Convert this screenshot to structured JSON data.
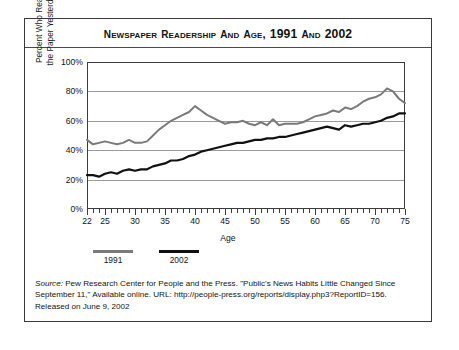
{
  "title": {
    "text": "NEWSPAPER READERSHIP AND AGE, 1991 AND 2002"
  },
  "axes": {
    "ylabel_line1": "Percent Who Read",
    "ylabel_line2": "the Paper Yesterday",
    "xlabel": "Age",
    "ytick_labels": [
      "100%",
      "80%",
      "60%",
      "40%",
      "20%",
      "0%"
    ],
    "xtick_labels": [
      "22",
      "25",
      "30",
      "35",
      "40",
      "45",
      "50",
      "55",
      "60",
      "65",
      "70",
      "75"
    ]
  },
  "legend": {
    "items": [
      {
        "label": "1991",
        "color": "#7a7a7a"
      },
      {
        "label": "2002",
        "color": "#111111"
      }
    ]
  },
  "source": {
    "label": "Source:",
    "text": " Pew Research Center for People and the Press. \"Public's News Habits Little Changed Since September 11,\" Available online. URL: http://people-press.org/reports/display.php3?ReportID=156. Released on June 9, 2002"
  },
  "chart_data": {
    "type": "line",
    "title": "NEWSPAPER READERSHIP AND AGE, 1991 AND 2002",
    "xlabel": "Age",
    "ylabel": "Percent Who Read the Paper Yesterday",
    "xlim": [
      22,
      75
    ],
    "ylim": [
      0,
      100
    ],
    "yticks": [
      0,
      20,
      40,
      60,
      80,
      100
    ],
    "xticks": [
      22,
      25,
      30,
      35,
      40,
      45,
      50,
      55,
      60,
      65,
      70,
      75
    ],
    "grid": true,
    "legend_position": "below-left",
    "x": [
      22,
      23,
      24,
      25,
      26,
      27,
      28,
      29,
      30,
      31,
      32,
      33,
      34,
      35,
      36,
      37,
      38,
      39,
      40,
      41,
      42,
      43,
      44,
      45,
      46,
      47,
      48,
      49,
      50,
      51,
      52,
      53,
      54,
      55,
      56,
      57,
      58,
      59,
      60,
      61,
      62,
      63,
      64,
      65,
      66,
      67,
      68,
      69,
      70,
      71,
      72,
      73,
      74,
      75
    ],
    "series": [
      {
        "name": "1991",
        "color": "#7a7a7a",
        "values": [
          47,
          44,
          45,
          46,
          45,
          44,
          45,
          47,
          45,
          45,
          46,
          50,
          54,
          57,
          60,
          62,
          64,
          66,
          70,
          67,
          64,
          62,
          60,
          58,
          59,
          59,
          60,
          58,
          57,
          59,
          57,
          61,
          57,
          58,
          58,
          58,
          59,
          61,
          63,
          64,
          65,
          67,
          66,
          69,
          68,
          70,
          73,
          75,
          76,
          78,
          82,
          80,
          75,
          72
        ]
      },
      {
        "name": "2002",
        "color": "#111111",
        "values": [
          23,
          23,
          22,
          24,
          25,
          24,
          26,
          27,
          26,
          27,
          27,
          29,
          30,
          31,
          33,
          33,
          34,
          36,
          37,
          39,
          40,
          41,
          42,
          43,
          44,
          45,
          45,
          46,
          47,
          47,
          48,
          48,
          49,
          49,
          50,
          51,
          52,
          53,
          54,
          55,
          56,
          55,
          54,
          57,
          56,
          57,
          58,
          58,
          59,
          60,
          62,
          63,
          65,
          65
        ]
      }
    ]
  }
}
